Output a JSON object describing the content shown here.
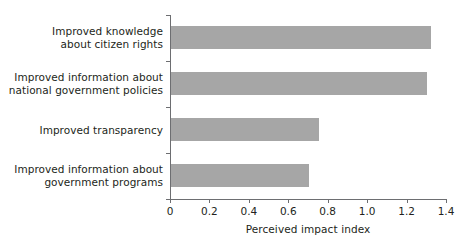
{
  "chart_data": {
    "type": "bar",
    "orientation": "horizontal",
    "title": "",
    "xlabel": "Perceived impact index",
    "ylabel": "",
    "xlim": [
      0,
      1.4
    ],
    "xticks": [
      "0",
      "0.2",
      "0.4",
      "0.6",
      "0.8",
      "1.0",
      "1.2",
      "1.4"
    ],
    "xtick_values": [
      0,
      0.2,
      0.4,
      0.6,
      0.8,
      1.0,
      1.2,
      1.4
    ],
    "grid": false,
    "legend": "none",
    "bar_color": "#a6a6a6",
    "axis_color": "#6d6e71",
    "text_color": "#231f20",
    "background": "#ffffff",
    "categories": [
      "Improved knowledge about citizen rights",
      "Improved information about national government policies",
      "Improved transparency",
      "Improved information about government programs"
    ],
    "category_lines": [
      [
        "Improved knowledge",
        "about citizen rights"
      ],
      [
        "Improved information about",
        "national government policies"
      ],
      [
        "Improved transparency"
      ],
      [
        "Improved information about",
        "government programs"
      ]
    ],
    "values": [
      1.32,
      1.3,
      0.75,
      0.7
    ]
  }
}
